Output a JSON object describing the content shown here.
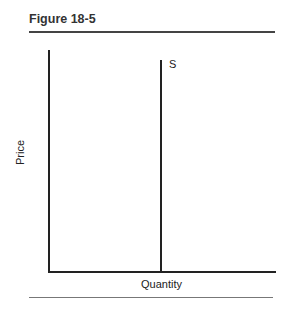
{
  "figure": {
    "title": "Figure 18-5"
  },
  "chart_data": {
    "type": "line",
    "title": "Figure 18-5",
    "xlabel": "Quantity",
    "ylabel": "Price",
    "grid": false,
    "legend": null,
    "series": [
      {
        "name": "S",
        "description": "Perfectly inelastic (vertical) supply curve",
        "points": [
          {
            "x": 0.5,
            "y": 0
          },
          {
            "x": 0.5,
            "y": 0.95
          }
        ]
      }
    ],
    "xlim": [
      0,
      1
    ],
    "ylim": [
      0,
      1
    ],
    "tick_labels": {
      "x": [],
      "y": []
    },
    "annotations": [
      "S"
    ]
  }
}
